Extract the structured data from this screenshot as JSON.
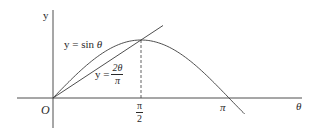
{
  "figure": {
    "axes": {
      "x_label": "θ",
      "y_label": "y",
      "origin_label": "O"
    },
    "ticks": {
      "half_pi": {
        "numerator": "π",
        "denominator": "2"
      },
      "pi": "π"
    },
    "curves": {
      "sine": {
        "label": "y = sin θ",
        "label_prefix": "y = sin ",
        "label_var": "θ"
      },
      "line": {
        "label_prefix": "y =",
        "numerator": "2θ",
        "denominator": "π"
      }
    },
    "colors": {
      "stroke": "#3a3a3a",
      "text": "#2a2a2a",
      "background": "#ffffff"
    }
  },
  "chart_data": {
    "type": "line",
    "title": "",
    "xlabel": "θ",
    "ylabel": "y",
    "x_ticks": [
      "O",
      "π/2",
      "π"
    ],
    "series": [
      {
        "name": "y = sin θ",
        "x": [
          0,
          0.785,
          1.571,
          2.356,
          3.142,
          3.4
        ],
        "values": [
          0,
          0.707,
          1,
          0.707,
          0,
          -0.255
        ]
      },
      {
        "name": "y = 2θ/π",
        "x": [
          0,
          1.571,
          1.95
        ],
        "values": [
          0,
          1,
          1.24
        ]
      }
    ],
    "annotations": [
      "dashed vertical line at θ = π/2 from x-axis to intersection point (π/2, 1)"
    ],
    "grid": false
  }
}
